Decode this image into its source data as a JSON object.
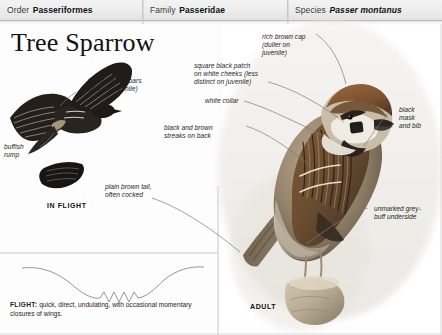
{
  "taxonomy": [
    {
      "key": "Order",
      "value": "Passeriformes",
      "italic": false
    },
    {
      "key": "Family",
      "value": "Passeridae",
      "italic": false
    },
    {
      "key": "Species",
      "value": "Passer montanus",
      "italic": true
    }
  ],
  "title": "Tree Sparrow",
  "captions": {
    "in_flight": "IN FLIGHT",
    "adult": "ADULT"
  },
  "labels": {
    "wingbars": "two pale wingbars\n(buff on juvenile)",
    "rump": "buffish\nrump",
    "tail": "plain brown tail,\noften cocked",
    "cheek_patch": "square black patch\non white cheeks (less\ndistinct on juvenile)",
    "cap": "rich brown cap\n(duller on\njuvenile)",
    "collar": "white collar",
    "back_streaks": "black and brown\nstreaks on back",
    "mask_bib": "black\nmask\nand bib",
    "underside": "unmarked grey-\nbuff underside"
  },
  "flight_note": {
    "heading": "FLIGHT:",
    "text": " quick, direct, undulating, with occasional momentary closures of wings."
  },
  "colors": {
    "header_bg": "#ececec",
    "rule": "#c9c9c9",
    "text": "#1d1d1d",
    "leader": "#6b6b6b",
    "bird_brown": "#8a6a4a",
    "bird_cap": "#7d5536",
    "bird_buff": "#cbbba6",
    "bird_black": "#2b2520",
    "perch": "#b9aa95"
  }
}
